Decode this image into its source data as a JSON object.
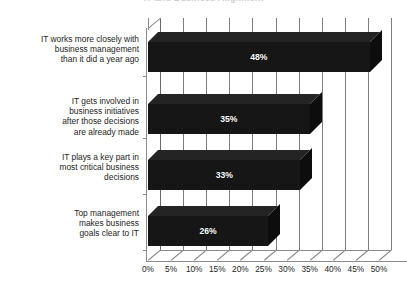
{
  "chart_data": {
    "type": "bar",
    "orientation": "horizontal",
    "style": "3d-bar",
    "title": "IT and Business Alignment",
    "title_visible": "partially-cropped",
    "xlabel": "",
    "ylabel": "",
    "xlim": [
      0,
      50
    ],
    "xtick_step": 5,
    "grid": true,
    "legend": "none",
    "bar_color": "#161616",
    "value_label_color": "#ffffff",
    "gridline_color": "#7d7d7d",
    "background_color": "#ffffff",
    "categories": [
      "IT works more closely with business management than it did a year ago",
      "IT gets involved in business initiatives after those decisions are already made",
      "IT plays a key part in most critical business decisions",
      "Top management makes business goals clear to IT"
    ],
    "category_lines": [
      [
        "IT works more closely with",
        "business management",
        "than it did a year ago"
      ],
      [
        "IT gets involved in",
        "business initiatives",
        "after those decisions",
        "are already made"
      ],
      [
        "IT plays a key part in",
        "most critical business",
        "decisions"
      ],
      [
        "Top management",
        "makes business",
        "goals clear to IT"
      ]
    ],
    "values": [
      48,
      35,
      33,
      26
    ],
    "value_labels": [
      "48%",
      "35%",
      "33%",
      "26%"
    ],
    "xtick_labels": [
      "0%",
      "5%",
      "10%",
      "15%",
      "20%",
      "25%",
      "30%",
      "35%",
      "40%",
      "45%",
      "50%"
    ],
    "xtick_values": [
      0,
      5,
      10,
      15,
      20,
      25,
      30,
      35,
      40,
      45,
      50
    ]
  }
}
